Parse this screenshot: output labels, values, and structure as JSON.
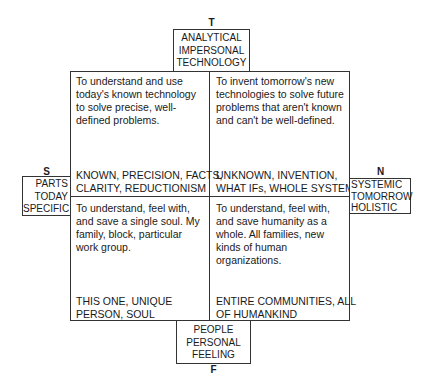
{
  "axes": {
    "top": {
      "letter": "T",
      "lines": [
        "ANALYTICAL",
        "IMPERSONAL",
        "TECHNOLOGY"
      ]
    },
    "bottom": {
      "letter": "F",
      "lines": [
        "PEOPLE",
        "PERSONAL",
        "FEELING"
      ]
    },
    "left": {
      "letter": "S",
      "lines": [
        "PARTS",
        "TODAY",
        "SPECIFIC"
      ]
    },
    "right": {
      "letter": "N",
      "lines": [
        "SYSTEMIC",
        "TOMORROW",
        "HOLISTIC"
      ]
    }
  },
  "quadrants": {
    "top_left": {
      "description": "To understand and use today's known technology to solve precise, well-defined problems.",
      "keywords": [
        "KNOWN, PRECISION, FACTS,",
        "CLARITY, REDUCTIONISM"
      ]
    },
    "top_right": {
      "description": "To invent tomorrow's new technologies to solve future problems that aren't known and can't be well-defined.",
      "keywords": [
        "UNKNOWN, INVENTION,",
        "WHAT IFs, WHOLE SYSTEMS"
      ]
    },
    "bottom_left": {
      "description": "To understand, feel with, and save a single soul. My family, block, particular work group.",
      "keywords": [
        "THIS ONE, UNIQUE",
        "PERSON, SOUL"
      ]
    },
    "bottom_right": {
      "description": "To understand, feel with, and save humanity as a whole. All families, new kinds of human organizations.",
      "keywords": [
        "ENTIRE COMMUNITIES, ALL",
        "OF HUMANKIND"
      ]
    }
  }
}
